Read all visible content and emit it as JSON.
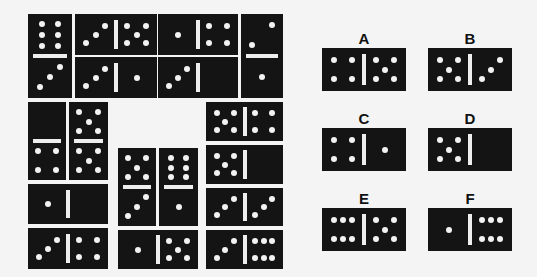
{
  "puzzle": {
    "pip_color": "#f2f2f2",
    "domino_color": "#141414",
    "background": "#f4f4f4",
    "grid_dominoes": [
      {
        "id": "g1",
        "orient": "v",
        "x": 28,
        "y": 14,
        "w": 44,
        "h": 84,
        "values": [
          6,
          3
        ]
      },
      {
        "id": "g2",
        "orient": "h",
        "x": 75,
        "y": 14,
        "w": 82,
        "h": 41,
        "values": [
          3,
          5
        ]
      },
      {
        "id": "g3",
        "orient": "h",
        "x": 158,
        "y": 14,
        "w": 80,
        "h": 41,
        "values": [
          1,
          4
        ]
      },
      {
        "id": "g4",
        "orient": "v",
        "x": 241,
        "y": 14,
        "w": 42,
        "h": 84,
        "values": [
          2,
          1
        ]
      },
      {
        "id": "g5",
        "orient": "h",
        "x": 75,
        "y": 57,
        "w": 82,
        "h": 41,
        "values": [
          3,
          1
        ]
      },
      {
        "id": "g6",
        "orient": "h",
        "x": 158,
        "y": 57,
        "w": 80,
        "h": 41,
        "values": [
          3,
          0
        ]
      },
      {
        "id": "g7",
        "orient": "v",
        "x": 28,
        "y": 102,
        "w": 38,
        "h": 78,
        "values": [
          0,
          4
        ]
      },
      {
        "id": "g8",
        "orient": "v",
        "x": 69,
        "y": 102,
        "w": 39,
        "h": 78,
        "values": [
          5,
          5
        ]
      },
      {
        "id": "g9",
        "orient": "h",
        "x": 206,
        "y": 102,
        "w": 77,
        "h": 39,
        "values": [
          5,
          4
        ]
      },
      {
        "id": "g10",
        "orient": "h",
        "x": 206,
        "y": 145,
        "w": 77,
        "h": 39,
        "values": [
          5,
          0
        ]
      },
      {
        "id": "g11",
        "orient": "v",
        "x": 118,
        "y": 148,
        "w": 38,
        "h": 78,
        "values": [
          5,
          3
        ]
      },
      {
        "id": "g12",
        "orient": "v",
        "x": 159,
        "y": 148,
        "w": 39,
        "h": 78,
        "values": [
          6,
          1
        ]
      },
      {
        "id": "g13",
        "orient": "h",
        "x": 28,
        "y": 184,
        "w": 80,
        "h": 40,
        "values": [
          1,
          0
        ]
      },
      {
        "id": "g14",
        "orient": "h",
        "x": 206,
        "y": 188,
        "w": 77,
        "h": 38,
        "values": [
          3,
          3
        ]
      },
      {
        "id": "g15",
        "orient": "h",
        "x": 28,
        "y": 228,
        "w": 80,
        "h": 41,
        "values": [
          3,
          4
        ]
      },
      {
        "id": "g16",
        "orient": "h",
        "x": 118,
        "y": 230,
        "w": 80,
        "h": 39,
        "values": [
          1,
          5
        ]
      },
      {
        "id": "g17",
        "orient": "h",
        "x": 206,
        "y": 230,
        "w": 77,
        "h": 39,
        "values": [
          3,
          6
        ]
      }
    ],
    "options": [
      {
        "label": "A",
        "x": 322,
        "y": 48,
        "w": 84,
        "h": 43,
        "values": [
          4,
          5
        ]
      },
      {
        "label": "B",
        "x": 428,
        "y": 48,
        "w": 84,
        "h": 43,
        "values": [
          5,
          3
        ]
      },
      {
        "label": "C",
        "x": 322,
        "y": 128,
        "w": 84,
        "h": 43,
        "values": [
          4,
          1
        ]
      },
      {
        "label": "D",
        "x": 428,
        "y": 128,
        "w": 84,
        "h": 43,
        "values": [
          5,
          0
        ]
      },
      {
        "label": "E",
        "x": 322,
        "y": 208,
        "w": 84,
        "h": 43,
        "values": [
          6,
          5
        ]
      },
      {
        "label": "F",
        "x": 428,
        "y": 208,
        "w": 84,
        "h": 43,
        "values": [
          1,
          6
        ]
      }
    ]
  }
}
